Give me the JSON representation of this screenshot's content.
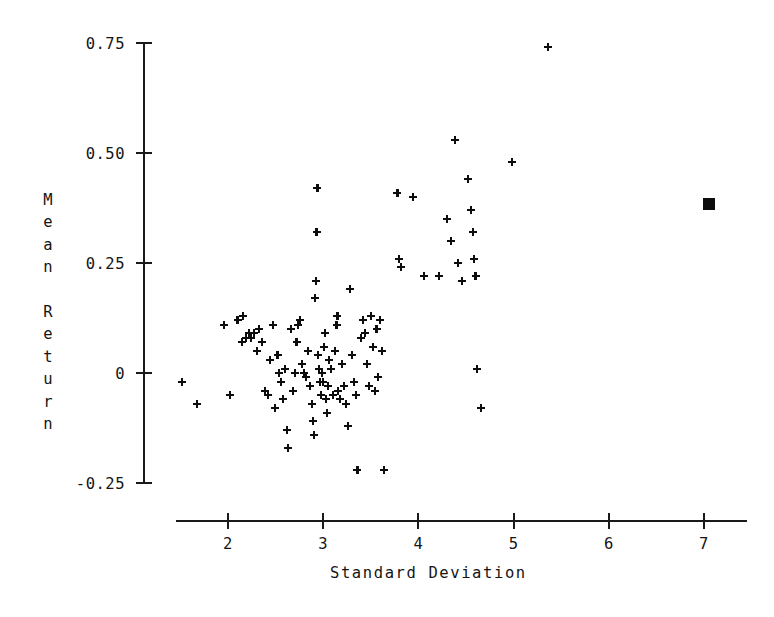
{
  "chart_data": {
    "type": "scatter",
    "title": "",
    "xlabel": "Standard Deviation",
    "ylabel": "Mean Return",
    "xlim": [
      1.35,
      7.6
    ],
    "ylim": [
      -0.33,
      0.82
    ],
    "grid": false,
    "legend": "none",
    "xticks": [
      2,
      3,
      4,
      5,
      6,
      7
    ],
    "xtick_labels": [
      "2",
      "3",
      "4",
      "5",
      "6",
      "7"
    ],
    "yticks": [
      0.75,
      0.5,
      0.25,
      0,
      -0.25
    ],
    "ytick_labels": [
      "0.75",
      "0.50",
      "0.25",
      "0",
      "-0.25"
    ],
    "series": [
      {
        "name": "portfolios",
        "marker": "plus",
        "color": "#0d0d0d",
        "points": [
          [
            1.52,
            -0.02
          ],
          [
            1.67,
            -0.07
          ],
          [
            1.96,
            0.11
          ],
          [
            2.02,
            -0.05
          ],
          [
            2.1,
            0.12
          ],
          [
            2.15,
            0.07
          ],
          [
            2.16,
            0.13
          ],
          [
            2.19,
            0.08
          ],
          [
            2.22,
            0.09
          ],
          [
            2.24,
            0.08
          ],
          [
            2.27,
            0.09
          ],
          [
            2.3,
            0.05
          ],
          [
            2.33,
            0.1
          ],
          [
            2.36,
            0.07
          ],
          [
            2.39,
            -0.04
          ],
          [
            2.42,
            -0.05
          ],
          [
            2.44,
            0.03
          ],
          [
            2.47,
            0.11
          ],
          [
            2.49,
            -0.08
          ],
          [
            2.52,
            0.04
          ],
          [
            2.54,
            0.0
          ],
          [
            2.56,
            -0.02
          ],
          [
            2.58,
            -0.06
          ],
          [
            2.6,
            0.01
          ],
          [
            2.62,
            -0.13
          ],
          [
            2.63,
            -0.17
          ],
          [
            2.66,
            0.1
          ],
          [
            2.68,
            -0.04
          ],
          [
            2.7,
            0.0
          ],
          [
            2.72,
            0.07
          ],
          [
            2.74,
            0.11
          ],
          [
            2.76,
            0.12
          ],
          [
            2.78,
            0.02
          ],
          [
            2.8,
            0.0
          ],
          [
            2.82,
            -0.01
          ],
          [
            2.84,
            0.05
          ],
          [
            2.86,
            -0.03
          ],
          [
            2.88,
            -0.07
          ],
          [
            2.89,
            -0.11
          ],
          [
            2.9,
            -0.14
          ],
          [
            2.91,
            0.17
          ],
          [
            2.92,
            0.21
          ],
          [
            2.93,
            0.32
          ],
          [
            2.94,
            0.42
          ],
          [
            2.95,
            0.04
          ],
          [
            2.96,
            0.01
          ],
          [
            2.97,
            -0.02
          ],
          [
            2.98,
            -0.05
          ],
          [
            2.99,
            0.0
          ],
          [
            3.0,
            -0.02
          ],
          [
            3.01,
            0.06
          ],
          [
            3.02,
            0.09
          ],
          [
            3.03,
            -0.06
          ],
          [
            3.04,
            -0.09
          ],
          [
            3.05,
            -0.03
          ],
          [
            3.06,
            0.03
          ],
          [
            3.08,
            0.01
          ],
          [
            3.1,
            -0.05
          ],
          [
            3.12,
            0.05
          ],
          [
            3.14,
            0.11
          ],
          [
            3.15,
            0.13
          ],
          [
            3.16,
            -0.04
          ],
          [
            3.18,
            -0.06
          ],
          [
            3.2,
            0.02
          ],
          [
            3.22,
            -0.03
          ],
          [
            3.24,
            -0.07
          ],
          [
            3.26,
            -0.12
          ],
          [
            3.28,
            0.19
          ],
          [
            3.3,
            0.04
          ],
          [
            3.32,
            -0.02
          ],
          [
            3.34,
            -0.05
          ],
          [
            3.36,
            -0.22
          ],
          [
            3.4,
            0.08
          ],
          [
            3.42,
            0.12
          ],
          [
            3.44,
            0.09
          ],
          [
            3.46,
            0.02
          ],
          [
            3.48,
            -0.03
          ],
          [
            3.5,
            0.13
          ],
          [
            3.52,
            0.06
          ],
          [
            3.54,
            -0.04
          ],
          [
            3.56,
            0.1
          ],
          [
            3.58,
            -0.01
          ],
          [
            3.6,
            0.12
          ],
          [
            3.62,
            0.05
          ],
          [
            3.64,
            -0.22
          ],
          [
            3.78,
            0.41
          ],
          [
            3.8,
            0.26
          ],
          [
            3.82,
            0.24
          ],
          [
            3.94,
            0.4
          ],
          [
            4.06,
            0.22
          ],
          [
            4.22,
            0.22
          ],
          [
            4.3,
            0.35
          ],
          [
            4.34,
            0.3
          ],
          [
            4.38,
            0.53
          ],
          [
            4.42,
            0.25
          ],
          [
            4.46,
            0.21
          ],
          [
            4.52,
            0.44
          ],
          [
            4.55,
            0.37
          ],
          [
            4.57,
            0.32
          ],
          [
            4.58,
            0.26
          ],
          [
            4.6,
            0.22
          ],
          [
            4.62,
            0.01
          ],
          [
            4.66,
            -0.08
          ],
          [
            4.98,
            0.48
          ],
          [
            5.36,
            0.74
          ]
        ]
      },
      {
        "name": "benchmark",
        "marker": "square",
        "color": "#0d0d0d",
        "points": [
          [
            7.05,
            0.385
          ]
        ]
      }
    ]
  },
  "axes": {
    "x_title": "Standard Deviation",
    "y_title_chars": [
      "M",
      "e",
      "a",
      "n",
      "",
      "R",
      "e",
      "t",
      "u",
      "r",
      "n"
    ]
  }
}
